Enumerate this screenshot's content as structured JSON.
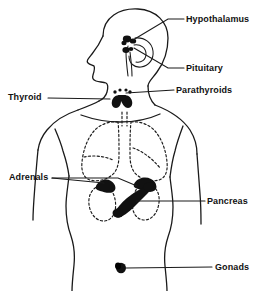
{
  "figure": {
    "type": "line-drawing",
    "background_color": "#ffffff",
    "ink_color": "#1a1a1a",
    "organ_fill_color": "#111111",
    "dashed_outline_color": "#1a1a1a"
  },
  "labels": {
    "hypothalamus": "Hypothalamus",
    "pituitary": "Pituitary",
    "parathyroids": "Parathyroids",
    "thyroid": "Thyroid",
    "adrenals": "Adrenals",
    "pancreas": "Pancreas",
    "gonads": "Gonads"
  },
  "callouts": [
    {
      "name": "hypothalamus",
      "side": "right",
      "label_x": 186,
      "label_y": 14,
      "leader_from_x": 168,
      "leader_from_y": 19,
      "leader_to_x": 133,
      "leader_to_y": 40
    },
    {
      "name": "pituitary",
      "side": "right",
      "label_x": 186,
      "label_y": 63,
      "leader_from_x": 168,
      "leader_from_y": 68,
      "leader_to_x": 137,
      "leader_to_y": 47
    },
    {
      "name": "parathyroids",
      "side": "right",
      "label_x": 176,
      "label_y": 85,
      "leader_from_x": 174,
      "leader_from_y": 90,
      "leader_to_x": 127,
      "leader_to_y": 95
    },
    {
      "name": "thyroid",
      "side": "left",
      "label_x": 8,
      "label_y": 92,
      "leader_from_x": 48,
      "leader_from_y": 97,
      "leader_to_x": 120,
      "leader_to_y": 100
    },
    {
      "name": "adrenals",
      "side": "left",
      "label_x": 9,
      "label_y": 172,
      "leader_from_x": 52,
      "leader_from_y": 177,
      "leader_to_x": 128,
      "leader_to_y": 186
    },
    {
      "name": "pancreas",
      "side": "right",
      "label_x": 207,
      "label_y": 196,
      "leader_from_x": 205,
      "leader_from_y": 201,
      "leader_to_x": 133,
      "leader_to_y": 203
    },
    {
      "name": "gonads",
      "side": "right",
      "label_x": 215,
      "label_y": 262,
      "leader_from_x": 212,
      "leader_from_y": 267,
      "leader_to_x": 126,
      "leader_to_y": 268
    }
  ],
  "organs": [
    {
      "name": "hypothalamus",
      "shape": "dark-cluster",
      "cx": 129,
      "cy": 40
    },
    {
      "name": "pituitary",
      "shape": "dark-nodule",
      "cx": 127,
      "cy": 49
    },
    {
      "name": "thyroid",
      "shape": "dark-butterfly",
      "cx": 120,
      "cy": 99
    },
    {
      "name": "parathyroids",
      "shape": "dark-dots",
      "cx": 122,
      "cy": 94
    },
    {
      "name": "lung-left",
      "shape": "dashed-outline",
      "cx": 103,
      "cy": 143
    },
    {
      "name": "lung-right",
      "shape": "dashed-outline",
      "cx": 146,
      "cy": 143
    },
    {
      "name": "kidney-left",
      "shape": "dashed-outline",
      "cx": 106,
      "cy": 201
    },
    {
      "name": "kidney-right",
      "shape": "dashed-outline",
      "cx": 145,
      "cy": 201
    },
    {
      "name": "adrenal-left",
      "shape": "dark-cap",
      "cx": 105,
      "cy": 186
    },
    {
      "name": "adrenal-right",
      "shape": "dark-cap",
      "cx": 144,
      "cy": 184
    },
    {
      "name": "pancreas",
      "shape": "dark-diagonal",
      "cx": 126,
      "cy": 197
    },
    {
      "name": "gonads",
      "shape": "dark-oval",
      "cx": 121,
      "cy": 268
    }
  ]
}
